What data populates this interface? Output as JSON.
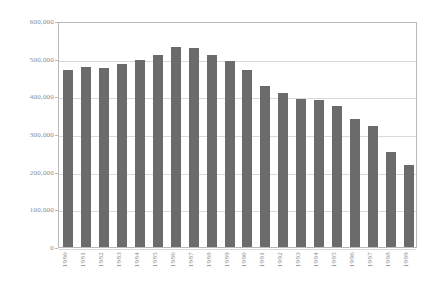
{
  "chart_data": {
    "type": "bar",
    "title": "",
    "subtitle": "",
    "xlabel": "",
    "ylabel": "",
    "categories": [
      "1980",
      "1981",
      "1982",
      "1983",
      "1984",
      "1985",
      "1986",
      "1987",
      "1988",
      "1989",
      "1990",
      "1991",
      "1992",
      "1993",
      "1994",
      "1995",
      "1996",
      "1997",
      "1998",
      "1999"
    ],
    "values": [
      470000,
      478000,
      474000,
      486000,
      497000,
      511000,
      530000,
      528000,
      511000,
      493000,
      470000,
      428000,
      409000,
      392000,
      391000,
      374000,
      341000,
      320000,
      253000,
      219000
    ],
    "series": [
      {
        "name": "",
        "values": [
          470000,
          478000,
          474000,
          486000,
          497000,
          511000,
          530000,
          528000,
          511000,
          493000,
          470000,
          428000,
          409000,
          392000,
          391000,
          374000,
          341000,
          320000,
          253000,
          219000
        ]
      }
    ],
    "ylim": [
      0,
      600000
    ],
    "ytick_labels": [
      "600,000",
      "500,000",
      "400,000",
      "300,000",
      "200,000",
      "100,000",
      "0"
    ],
    "ytick_values": [
      600000,
      500000,
      400000,
      300000,
      200000,
      100000,
      0
    ],
    "grid": true,
    "legend": false,
    "legend_position": "none",
    "bar_color": "#6b6b6b",
    "gridline_color": "#d9d9d9",
    "frame_color": "#b9b9b9",
    "axis_label_color": "#8a8a8a",
    "background_color": "#ffffff"
  }
}
